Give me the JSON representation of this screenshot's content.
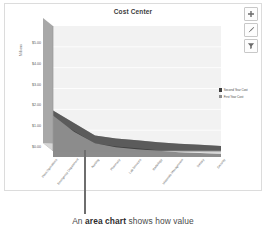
{
  "chart_card": {
    "title": "Cost Center"
  },
  "tools": [
    {
      "name": "chart-elements-button",
      "icon": "plus-icon"
    },
    {
      "name": "chart-styles-button",
      "icon": "brush-icon"
    },
    {
      "name": "chart-filters-button",
      "icon": "filter-icon"
    }
  ],
  "legend": {
    "items": [
      {
        "label": "Second Year Cost",
        "color": "#3f3f3f"
      },
      {
        "label": "First Year Cost",
        "color": "#8c8c8c"
      }
    ]
  },
  "caption": {
    "prefix": "An ",
    "emphasis": "area chart",
    "suffix": " shows how value"
  },
  "colors": {
    "series_second_year": "#3f3f3f",
    "series_first_year": "#8c8c8c",
    "wall_side": "#a8a8a8",
    "wall_top": "#8f8f8f",
    "plot_background": "#f2f2f2",
    "gridline": "#ffffff",
    "border": "#dcdcdc"
  },
  "chart_data": {
    "type": "area",
    "title": "Cost Center",
    "xlabel": "",
    "ylabel": "Millions",
    "grid": true,
    "legend_position": "right",
    "ylim": [
      0,
      6
    ],
    "yticks": [
      0,
      1,
      2,
      3,
      4,
      5
    ],
    "ytick_labels": [
      "$0.00",
      "$1.00",
      "$2.00",
      "$3.00",
      "$4.00",
      "$5.00"
    ],
    "categories": [
      "Plant Operations",
      "Emergency Department",
      "Nursing",
      "Pharmacy",
      "Lab Services",
      "Radiology",
      "Materials Management",
      "Dietary",
      "Security"
    ],
    "series": [
      {
        "name": "First Year Cost",
        "values": [
          2.55,
          1.55,
          0.85,
          0.6,
          0.48,
          0.38,
          0.3,
          0.24,
          0.18
        ]
      },
      {
        "name": "Second Year Cost",
        "values": [
          1.95,
          1.35,
          0.75,
          0.6,
          0.52,
          0.42,
          0.35,
          0.3,
          0.24
        ]
      }
    ]
  }
}
